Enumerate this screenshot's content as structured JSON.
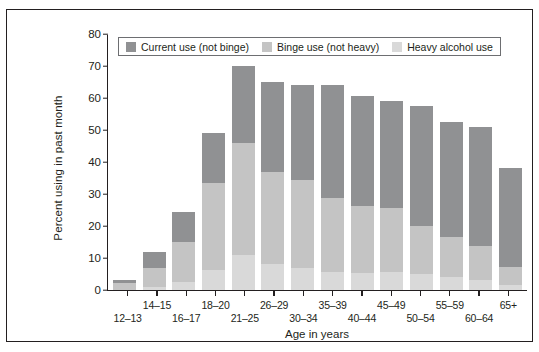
{
  "chart_data": {
    "type": "bar",
    "title": "",
    "subtitle": "",
    "xlabel": "Age in years",
    "ylabel": "Percent using in past month",
    "ylim": [
      0,
      80
    ],
    "yticks": [
      0,
      10,
      20,
      30,
      40,
      50,
      60,
      70,
      80
    ],
    "grid": false,
    "stacked": true,
    "legend_position": "top-left-inside",
    "categories": [
      "12–13",
      "14–15",
      "16–17",
      "18–20",
      "21–25",
      "26–29",
      "30–34",
      "35–39",
      "40–44",
      "45–49",
      "50–54",
      "55–59",
      "60–64",
      "65+"
    ],
    "series": [
      {
        "name": "Heavy alcohol use",
        "color": "#d9d9d9",
        "values": [
          0.0,
          0.9,
          2.5,
          6.3,
          11.0,
          8.2,
          7.0,
          5.7,
          5.4,
          5.7,
          5.0,
          4.0,
          3.1,
          1.7
        ]
      },
      {
        "name": "Binge use (not heavy)",
        "color": "#c4c4c4",
        "values": [
          2.1,
          6.1,
          12.5,
          27.0,
          35.0,
          28.8,
          27.5,
          23.0,
          21.0,
          19.8,
          15.0,
          12.5,
          10.7,
          5.4
        ]
      },
      {
        "name": "Current use (not binge)",
        "color": "#909193",
        "values": [
          0.9,
          5.0,
          9.5,
          15.7,
          24.0,
          28.0,
          29.5,
          35.3,
          34.2,
          33.5,
          37.5,
          36.0,
          37.3,
          30.9
        ]
      }
    ],
    "totals": [
      3.0,
      12.0,
      24.5,
      49.0,
      70.0,
      65.0,
      64.0,
      64.0,
      60.6,
      59.0,
      57.5,
      52.5,
      51.1,
      38.0
    ]
  },
  "legend": {
    "items": [
      {
        "label": "Current use (not binge)",
        "color": "#909193"
      },
      {
        "label": "Binge use (not heavy)",
        "color": "#c4c4c4"
      },
      {
        "label": "Heavy alcohol use",
        "color": "#d9d9d9"
      }
    ]
  },
  "axes": {
    "y_title": "Percent using in past month",
    "x_title": "Age in years",
    "y_tick_labels": [
      "0",
      "10",
      "20",
      "30",
      "40",
      "50",
      "60",
      "70",
      "80"
    ],
    "x_tick_labels": [
      "12–13",
      "14–15",
      "16–17",
      "18–20",
      "21–25",
      "26–29",
      "30–34",
      "35–39",
      "40–44",
      "45–49",
      "50–54",
      "55–59",
      "60–64",
      "65+"
    ]
  },
  "colors": {
    "axis": "#231f20",
    "frame": "#231f20",
    "background": "#ffffff",
    "current_use": "#909193",
    "binge_use": "#c4c4c4",
    "heavy_use": "#d9d9d9"
  }
}
